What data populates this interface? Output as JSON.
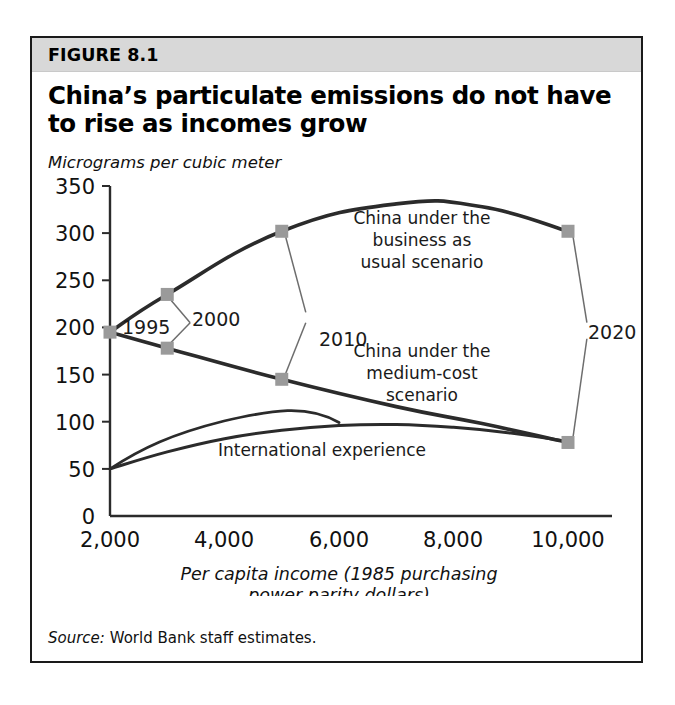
{
  "figure": {
    "label": "FIGURE 8.1",
    "title_line1": "China’s particulate emissions do not have",
    "title_line2": "to rise as incomes grow",
    "unit_label": "Micrograms per cubic meter",
    "source_key": "Source:",
    "source_value": " World Bank staff estimates.",
    "header_bg": "#d8d8d8",
    "border_color": "#1a1a1a",
    "marker_color": "#9a9a9a",
    "line_color": "#2b2b2b"
  },
  "chart_data": {
    "type": "line",
    "title": "China’s particulate emissions do not have to rise as incomes grow",
    "subtitle": "Micrograms per cubic meter",
    "xlabel": "Per capita income (1985 purchasing power parity dollars)",
    "ylabel": "Micrograms per cubic meter",
    "xlim": [
      2000,
      10800
    ],
    "ylim": [
      0,
      350
    ],
    "xticks": [
      2000,
      4000,
      6000,
      8000,
      10000
    ],
    "xtick_labels": [
      "2,000",
      "4,000",
      "6,000",
      "8,000",
      "10,000"
    ],
    "yticks": [
      0,
      50,
      100,
      150,
      200,
      250,
      300,
      350
    ],
    "ytick_labels": [
      "0",
      "50",
      "100",
      "150",
      "200",
      "250",
      "300",
      "350"
    ],
    "grid": false,
    "legend_position": "inline-annotations",
    "series": [
      {
        "name": "China under the business as usual scenario",
        "marker": "square",
        "x": [
          2000,
          3000,
          5000,
          7000,
          8500,
          10000
        ],
        "y": [
          195,
          235,
          302,
          331,
          328,
          302
        ],
        "marker_points": [
          {
            "x": 2000,
            "y": 195,
            "year": "1995"
          },
          {
            "x": 3000,
            "y": 235,
            "year": "2000"
          },
          {
            "x": 5000,
            "y": 302,
            "year": "2010"
          },
          {
            "x": 10000,
            "y": 302,
            "year": "2020"
          }
        ]
      },
      {
        "name": "China under the medium-cost scenario",
        "marker": "square",
        "x": [
          2000,
          3000,
          5000,
          7000,
          8500,
          10000
        ],
        "y": [
          195,
          178,
          145,
          116,
          98,
          78
        ],
        "marker_points": [
          {
            "x": 2000,
            "y": 195,
            "year": "1995"
          },
          {
            "x": 3000,
            "y": 178,
            "year": "2000"
          },
          {
            "x": 5000,
            "y": 145,
            "year": "2010"
          },
          {
            "x": 10000,
            "y": 78,
            "year": "2020"
          }
        ]
      },
      {
        "name": "International experience",
        "marker": "none",
        "x": [
          2000,
          3000,
          4000,
          5000,
          6000,
          7000,
          8000,
          9000,
          10000
        ],
        "y": [
          50,
          68,
          82,
          91,
          96,
          97,
          94,
          88,
          79
        ],
        "marker_points": []
      }
    ],
    "annotations": [
      {
        "id": "bau",
        "lines": [
          "China under the",
          "business as",
          "usual scenario"
        ],
        "x": 6500,
        "y": 300
      },
      {
        "id": "medium",
        "lines": [
          "China under the",
          "medium-cost",
          "scenario"
        ],
        "x": 6500,
        "y": 175
      },
      {
        "id": "international",
        "lines": [
          "International experience"
        ],
        "x": 5600,
        "y": 62
      }
    ],
    "year_labels": [
      {
        "label": "1995",
        "x": 2300,
        "y": 193
      },
      {
        "label": "2000",
        "x": 3350,
        "y": 205
      },
      {
        "label": "2010",
        "x": 5300,
        "y": 212
      },
      {
        "label": "2020",
        "x": 10350,
        "y": 190
      }
    ]
  }
}
